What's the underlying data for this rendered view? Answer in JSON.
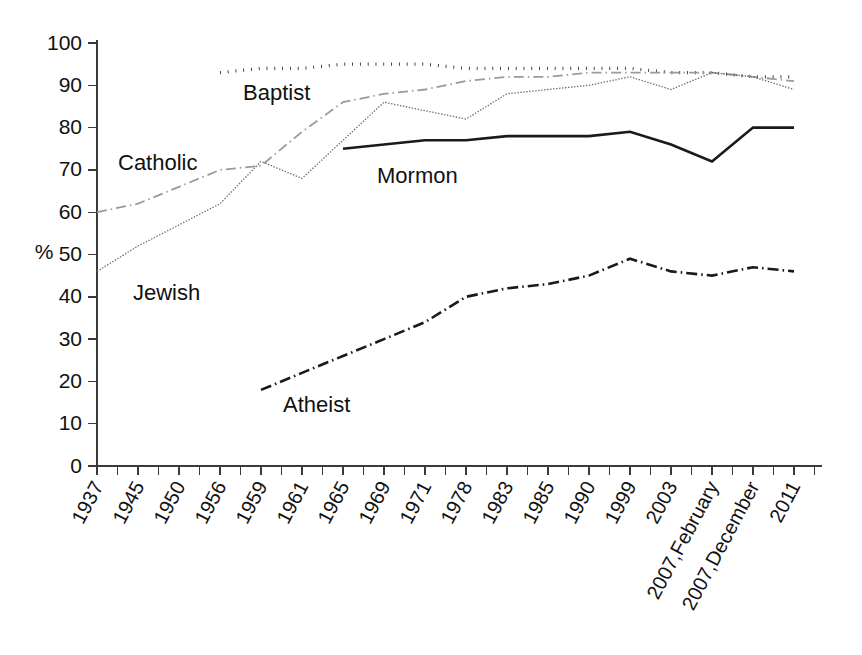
{
  "chart_data": {
    "type": "line",
    "title": "",
    "xlabel": "",
    "ylabel": "%",
    "ylim": [
      0,
      100
    ],
    "yticks": [
      0,
      10,
      20,
      30,
      40,
      50,
      60,
      70,
      80,
      90,
      100
    ],
    "grid": false,
    "legend": "inline-labels",
    "categories": [
      "1937",
      "1945",
      "1950",
      "1956",
      "1959",
      "1961",
      "1965",
      "1969",
      "1971",
      "1978",
      "1983",
      "1985",
      "1990",
      "1999",
      "2003",
      "2007,February",
      "2007,December",
      "2011"
    ],
    "series": [
      {
        "name": "Baptist",
        "style": "dotted",
        "color": "#1a1a1a",
        "values": [
          null,
          null,
          null,
          93,
          94,
          94,
          95,
          95,
          95,
          94,
          94,
          94,
          94,
          94,
          93,
          93,
          92,
          92
        ]
      },
      {
        "name": "Catholic",
        "style": "dash-dot-light",
        "color": "#9a9a9a",
        "values": [
          60,
          62,
          66,
          70,
          71,
          79,
          86,
          88,
          89,
          91,
          92,
          92,
          93,
          93,
          93,
          93,
          92,
          91
        ]
      },
      {
        "name": "Jewish",
        "style": "fine-dotted",
        "color": "#6a6a6a",
        "values": [
          46,
          52,
          57,
          62,
          72,
          68,
          77,
          86,
          84,
          82,
          88,
          89,
          90,
          92,
          89,
          93,
          92,
          89
        ]
      },
      {
        "name": "Mormon",
        "style": "solid",
        "color": "#1a1a1a",
        "values": [
          null,
          null,
          null,
          null,
          null,
          null,
          75,
          76,
          77,
          77,
          78,
          78,
          78,
          79,
          76,
          72,
          80,
          80
        ]
      },
      {
        "name": "Atheist",
        "style": "dash-dot",
        "color": "#1a1a1a",
        "values": [
          null,
          null,
          null,
          null,
          18,
          22,
          26,
          30,
          34,
          40,
          42,
          43,
          45,
          49,
          46,
          45,
          47,
          46
        ]
      }
    ],
    "series_labels": [
      {
        "name": "Baptist",
        "text": "Baptist",
        "x": 243,
        "y": 100
      },
      {
        "name": "Catholic",
        "text": "Catholic",
        "x": 118,
        "y": 170
      },
      {
        "name": "Jewish",
        "text": "Jewish",
        "x": 133,
        "y": 300
      },
      {
        "name": "Mormon",
        "text": "Mormon",
        "x": 377,
        "y": 183
      },
      {
        "name": "Atheist",
        "text": "Atheist",
        "x": 283,
        "y": 412
      }
    ]
  }
}
